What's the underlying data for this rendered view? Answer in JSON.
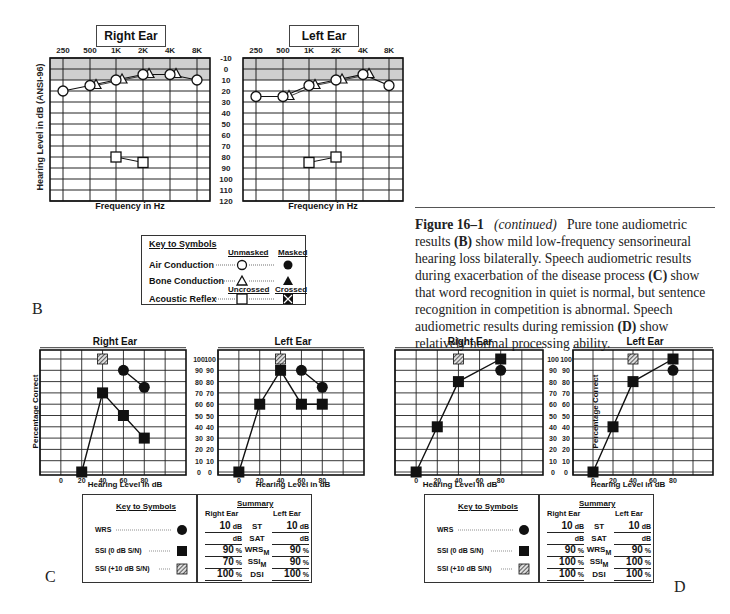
{
  "figure": {
    "caption_label": "Figure 16–1",
    "caption_italic": "(continued)",
    "caption_text_1": "Pure tone audiometric results",
    "caption_b": "(B)",
    "caption_text_2": "show mild low-frequency sensorineural hearing loss bilaterally. Speech audiometric results during exacerbation of the disease process",
    "caption_c": "(C)",
    "caption_text_3": "show that word recognition in quiet is normal, but sentence recognition in competition is abnormal. Speech audiometric results during remission",
    "caption_d": "(D)",
    "caption_text_4": "show relatively normal processing ability."
  },
  "panel_labels": {
    "b": "B",
    "c": "C",
    "d": "D"
  },
  "audiogram": {
    "right_title": "Right Ear",
    "left_title": "Left Ear",
    "x_label": "Frequency in Hz",
    "y_label": "Hearing Level in dB (ANSI-96)",
    "freq_ticks": [
      "250",
      "500",
      "1K",
      "2K",
      "4K",
      "8K"
    ],
    "db_ticks": [
      "-10",
      "0",
      "10",
      "20",
      "30",
      "40",
      "50",
      "60",
      "70",
      "80",
      "90",
      "100",
      "110",
      "120"
    ],
    "key": {
      "title": "Key to Symbols",
      "unmasked": "Unmasked",
      "masked": "Masked",
      "air": "Air Conduction",
      "bone": "Bone Conduction",
      "uncrossed": "Uncrossed",
      "crossed": "Crossed",
      "reflex": "Acoustic Reflex"
    }
  },
  "speech": {
    "right_title": "Right Ear",
    "left_title": "Left Ear",
    "x_label": "Hearing Level in dB",
    "y_label": "Percentage Correct",
    "x_ticks": [
      "0",
      "20",
      "40",
      "60",
      "80"
    ],
    "y_ticks": [
      "100",
      "90",
      "80",
      "70",
      "60",
      "50",
      "40",
      "30",
      "20",
      "10",
      "0"
    ],
    "key": {
      "title": "Key to Symbols",
      "wrs": "WRS",
      "ssi0": "SSI (0 dB S/N)",
      "ssi10": "SSI (+10 dB S/N)"
    },
    "summary_C": {
      "title": "Summary",
      "right_head": "Right Ear",
      "left_head": "Left Ear",
      "rows": [
        {
          "label": "ST",
          "sub": "",
          "right": "10",
          "right_unit": "dB",
          "left": "10",
          "left_unit": "dB"
        },
        {
          "label": "SAT",
          "sub": "",
          "right": "",
          "right_unit": "dB",
          "left": "",
          "left_unit": "dB"
        },
        {
          "label": "WRS",
          "sub": "M",
          "right": "90",
          "right_unit": "%",
          "left": "90",
          "left_unit": "%"
        },
        {
          "label": "SSI",
          "sub": "M",
          "right": "70",
          "right_unit": "%",
          "left": "90",
          "left_unit": "%"
        },
        {
          "label": "DSI",
          "sub": "",
          "right": "100",
          "right_unit": "%",
          "left": "100",
          "left_unit": "%"
        }
      ]
    },
    "summary_D": {
      "title": "Summary",
      "right_head": "Right Ear",
      "left_head": "Left Ear",
      "rows": [
        {
          "label": "ST",
          "sub": "",
          "right": "10",
          "right_unit": "dB",
          "left": "10",
          "left_unit": "dB"
        },
        {
          "label": "SAT",
          "sub": "",
          "right": "",
          "right_unit": "dB",
          "left": "",
          "left_unit": "dB"
        },
        {
          "label": "WRS",
          "sub": "M",
          "right": "90",
          "right_unit": "%",
          "left": "90",
          "left_unit": "%"
        },
        {
          "label": "SSI",
          "sub": "M",
          "right": "100",
          "right_unit": "%",
          "left": "100",
          "left_unit": "%"
        },
        {
          "label": "DSI",
          "sub": "",
          "right": "100",
          "right_unit": "%",
          "left": "100",
          "left_unit": "%"
        }
      ]
    }
  },
  "chart_data": [
    {
      "type": "line",
      "title": "Right Ear (B, audiogram)",
      "xlabel": "Frequency in Hz",
      "ylabel": "Hearing Level in dB (ANSI-96)",
      "categories": [
        "250",
        "500",
        "1K",
        "2K",
        "4K",
        "8K"
      ],
      "ylim": [
        120,
        -10
      ],
      "grid": true,
      "series": [
        {
          "name": "Air Conduction (unmasked)",
          "values": [
            20,
            15,
            10,
            5,
            5,
            10
          ]
        },
        {
          "name": "Bone Conduction (unmasked)",
          "values": [
            null,
            15,
            10,
            5,
            5,
            null
          ]
        },
        {
          "name": "Acoustic Reflex (uncrossed)",
          "values": [
            null,
            null,
            80,
            85,
            null,
            null
          ]
        }
      ]
    },
    {
      "type": "line",
      "title": "Left Ear (B, audiogram)",
      "xlabel": "Frequency in Hz",
      "ylabel": "Hearing Level in dB (ANSI-96)",
      "categories": [
        "250",
        "500",
        "1K",
        "2K",
        "4K",
        "8K"
      ],
      "ylim": [
        120,
        -10
      ],
      "grid": true,
      "series": [
        {
          "name": "Air Conduction (unmasked)",
          "values": [
            25,
            25,
            15,
            10,
            5,
            15
          ]
        },
        {
          "name": "Bone Conduction (unmasked)",
          "values": [
            null,
            25,
            15,
            10,
            5,
            null
          ]
        },
        {
          "name": "Acoustic Reflex (uncrossed)",
          "values": [
            null,
            null,
            85,
            80,
            null,
            null
          ]
        }
      ]
    },
    {
      "type": "line",
      "title": "Right Ear (C, speech audiometry - exacerbation)",
      "xlabel": "Hearing Level in dB",
      "ylabel": "Percentage Correct",
      "x": [
        0,
        20,
        40,
        60,
        80
      ],
      "ylim": [
        0,
        100
      ],
      "grid": true,
      "series": [
        {
          "name": "WRS",
          "points": [
            [
              60,
              90
            ],
            [
              80,
              75
            ]
          ]
        },
        {
          "name": "SSI (0 dB S/N)",
          "points": [
            [
              20,
              0
            ],
            [
              40,
              70
            ],
            [
              60,
              50
            ],
            [
              80,
              30
            ]
          ]
        },
        {
          "name": "SSI (+10 dB S/N)",
          "points": [
            [
              40,
              100
            ]
          ]
        }
      ]
    },
    {
      "type": "line",
      "title": "Left Ear (C, speech audiometry - exacerbation)",
      "xlabel": "Hearing Level in dB",
      "ylabel": "Percentage Correct",
      "x": [
        0,
        20,
        40,
        60,
        80
      ],
      "ylim": [
        0,
        100
      ],
      "grid": true,
      "series": [
        {
          "name": "WRS",
          "points": [
            [
              60,
              90
            ],
            [
              80,
              75
            ]
          ]
        },
        {
          "name": "SSI (0 dB S/N)",
          "points": [
            [
              0,
              0
            ],
            [
              20,
              60
            ],
            [
              40,
              90
            ],
            [
              60,
              60
            ],
            [
              80,
              60
            ]
          ]
        },
        {
          "name": "SSI (+10 dB S/N)",
          "points": [
            [
              40,
              100
            ]
          ]
        }
      ]
    },
    {
      "type": "line",
      "title": "Right Ear (D, speech audiometry - remission)",
      "xlabel": "Hearing Level in dB",
      "ylabel": "Percentage Correct",
      "x": [
        0,
        20,
        40,
        60,
        80
      ],
      "ylim": [
        0,
        100
      ],
      "grid": true,
      "series": [
        {
          "name": "WRS",
          "points": [
            [
              80,
              90
            ]
          ]
        },
        {
          "name": "SSI (0 dB S/N)",
          "points": [
            [
              0,
              0
            ],
            [
              20,
              40
            ],
            [
              40,
              80
            ],
            [
              80,
              100
            ]
          ]
        },
        {
          "name": "SSI (+10 dB S/N)",
          "points": [
            [
              40,
              100
            ]
          ]
        }
      ]
    },
    {
      "type": "line",
      "title": "Left Ear (D, speech audiometry - remission)",
      "xlabel": "Hearing Level in dB",
      "ylabel": "Percentage Correct",
      "x": [
        0,
        20,
        40,
        60,
        80
      ],
      "ylim": [
        0,
        100
      ],
      "grid": true,
      "series": [
        {
          "name": "WRS",
          "points": [
            [
              80,
              90
            ]
          ]
        },
        {
          "name": "SSI (0 dB S/N)",
          "points": [
            [
              0,
              0
            ],
            [
              20,
              40
            ],
            [
              40,
              80
            ],
            [
              80,
              100
            ]
          ]
        },
        {
          "name": "SSI (+10 dB S/N)",
          "points": [
            [
              40,
              100
            ]
          ]
        }
      ]
    }
  ]
}
